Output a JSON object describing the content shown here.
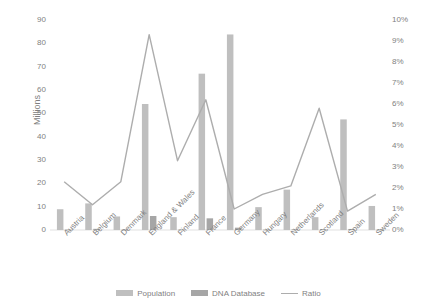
{
  "chart_data": {
    "type": "bar",
    "title": "",
    "subtitle": "",
    "xlabel": "",
    "ylabel": "Millions",
    "y2label": "",
    "categories": [
      "Austria",
      "Belgium",
      "Denmark",
      "England & Wales",
      "Finland",
      "France",
      "Germany",
      "Hungary",
      "Netherlands",
      "Scotland",
      "Spain",
      "Sweden"
    ],
    "ylim": [
      0,
      90
    ],
    "yticks": [
      0,
      10,
      20,
      30,
      40,
      50,
      60,
      70,
      80,
      90
    ],
    "ytick_labels": [
      "0",
      "10",
      "20",
      "30",
      "40",
      "50",
      "60",
      "70",
      "80",
      "90"
    ],
    "y2lim": [
      0,
      0.1
    ],
    "y2ticks": [
      0,
      0.01,
      0.02,
      0.03,
      0.04,
      0.05,
      0.06,
      0.07,
      0.08,
      0.09,
      0.1
    ],
    "y2tick_labels": [
      "0%",
      "1%",
      "2%",
      "3%",
      "4%",
      "5%",
      "6%",
      "7%",
      "8%",
      "9%",
      "10%"
    ],
    "grid": false,
    "legend_position": "bottom",
    "series": [
      {
        "name": "Population",
        "type": "bar",
        "axis": "left",
        "color": "#bfbfbf",
        "values": [
          8.9,
          11.4,
          5.8,
          54.0,
          5.5,
          67.0,
          83.8,
          9.8,
          17.3,
          5.5,
          47.4,
          10.3
        ]
      },
      {
        "name": "DNA Database",
        "type": "bar",
        "axis": "left",
        "color": "#a6a6a6",
        "values": [
          0.2,
          0.5,
          0.15,
          6.0,
          0.2,
          5.0,
          1.0,
          0.2,
          0.3,
          0.35,
          0.45,
          0.18
        ]
      },
      {
        "name": "Ratio",
        "type": "line",
        "axis": "right",
        "color": "#adadad",
        "values": [
          0.023,
          0.012,
          0.023,
          0.093,
          0.033,
          0.062,
          0.01,
          0.017,
          0.021,
          0.058,
          0.009,
          0.017
        ]
      }
    ]
  },
  "legend": {
    "items": [
      {
        "label": "Population",
        "marker": "bar"
      },
      {
        "label": "DNA Database",
        "marker": "bar"
      },
      {
        "label": "Ratio",
        "marker": "line"
      }
    ]
  }
}
